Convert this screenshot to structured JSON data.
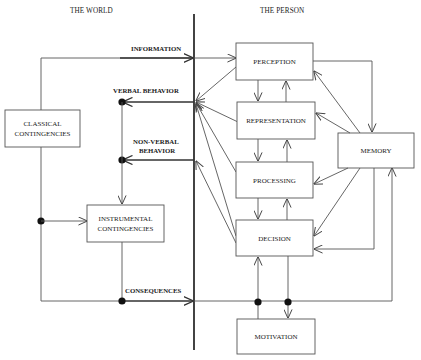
{
  "sections": {
    "world": "THE WORLD",
    "person": "THE PERSON"
  },
  "world_boxes": {
    "classical": [
      "CLASSICAL",
      "CONTINGENCIES"
    ],
    "instrumental": [
      "INSTRUMENTAL",
      "CONTINGENCIES"
    ]
  },
  "person_boxes": {
    "perception": "PERCEPTION",
    "representation": "REPRESENTATION",
    "processing": "PROCESSING",
    "decision": "DECISION",
    "memory": "MEMORY",
    "motivation": "MOTIVATION"
  },
  "flows": {
    "information": "INFORMATION",
    "verbal_behavior": "VERBAL BEHAVIOR",
    "non_verbal_behavior": [
      "NON-VERBAL",
      "BEHAVIOR"
    ],
    "consequences": "CONSEQUENCES"
  },
  "colors": {
    "line": "#555555",
    "divider": "#222222",
    "dot": "#111111",
    "background": "#ffffff"
  }
}
